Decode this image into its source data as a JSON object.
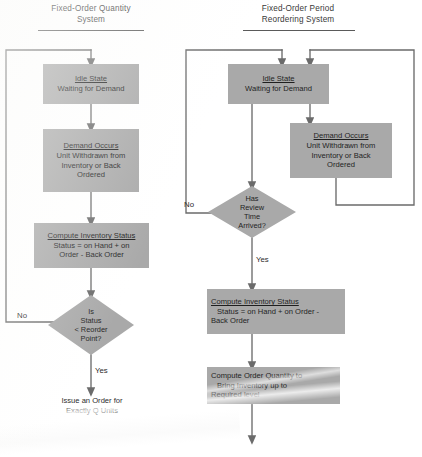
{
  "figure": {
    "type": "flowchart",
    "colors": {
      "node_fill": "#a9a9a9",
      "line": "#6b6b6b",
      "text": "#1f1f1f",
      "background": "#ffffff"
    }
  },
  "left_chart": {
    "title": "Fixed-Order Quantity\nSystem",
    "nodes": {
      "idle": {
        "head": "Idle State",
        "body": "Waiting for Demand"
      },
      "demand": {
        "head": "Demand Occurs",
        "line1": "Unit Withdrawn from",
        "line2": "Inventory or Back",
        "line3": "Ordered"
      },
      "compute": {
        "head": "Compute Inventory Status",
        "line1": "Status = on Hand + on",
        "line2": "Order - Back Order"
      },
      "decision": {
        "line1": "Is",
        "line2": "Status",
        "line3": "< Reorder",
        "line4": "Point?"
      },
      "issue": {
        "text": "Issue an Order for\nExactly Q Units"
      }
    },
    "edges": {
      "no": "No",
      "yes": "Yes"
    }
  },
  "right_chart": {
    "title": "Fixed-Order Period\nReordering System",
    "nodes": {
      "idle": {
        "head": "Idle State",
        "body": "Waiting for Demand"
      },
      "demand": {
        "head": "Demand Occurs",
        "line1": "Unit Withdrawn from",
        "line2": "Inventory or Back",
        "line3": "Ordered"
      },
      "decision": {
        "line1": "Has",
        "line2": "Review",
        "line3": "Time",
        "line4": "Arrived?"
      },
      "compute": {
        "head": "Compute Inventory Status",
        "line1": "Status = on Hand + on Order -",
        "line2": "Back Order"
      },
      "order_qty": {
        "line1": "Compute Order Quantity to",
        "line2": "Bring Inventory up to",
        "line3": "Required level"
      }
    },
    "edges": {
      "no": "No",
      "yes": "Yes"
    }
  }
}
